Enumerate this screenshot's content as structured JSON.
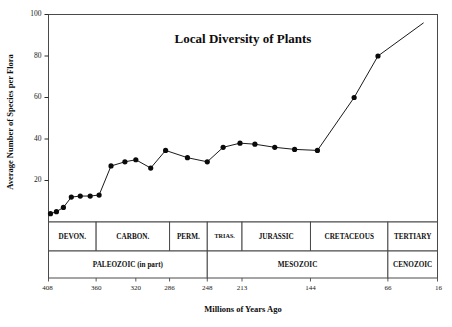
{
  "figure": {
    "title": "Local Diversity of Plants",
    "xlabel": "Millions of Years Ago",
    "ylabel": "Average Number of Species per Flora"
  },
  "chart_data": {
    "type": "line",
    "title": "Local Diversity of Plants",
    "xlabel": "Millions of Years Ago",
    "ylabel": "Average Number of Species per Flora",
    "xlim": [
      408,
      16
    ],
    "ylim": [
      0,
      100
    ],
    "x_inverted": true,
    "grid": false,
    "legend": "none",
    "xticks": [
      408,
      360,
      320,
      286,
      248,
      213,
      144,
      66,
      16
    ],
    "xtick_labels": [
      "408",
      "360",
      "320",
      "286",
      "248",
      "213",
      "144",
      "66",
      "16"
    ],
    "yticks": [
      0,
      20,
      40,
      60,
      80,
      100
    ],
    "ytick_labels": [
      "0",
      "20",
      "40",
      "60",
      "80",
      "100"
    ],
    "series": [
      {
        "name": "Average number of species per flora",
        "marker": "filled-circle",
        "x": [
          406,
          400,
          393,
          385,
          376,
          366,
          357,
          345,
          331,
          320,
          305,
          290,
          268,
          248,
          232,
          215,
          200,
          180,
          160,
          137,
          100,
          76,
          30
        ],
        "y": [
          4,
          5,
          7,
          12,
          12.5,
          12.5,
          13,
          27,
          29,
          30,
          26,
          34.5,
          31,
          29,
          36,
          38,
          37.5,
          36,
          35,
          34.5,
          60,
          80,
          96
        ]
      }
    ],
    "annotations": []
  },
  "timescale": {
    "periods": [
      {
        "label": "DEVON.",
        "start": 408,
        "end": 360,
        "compact": false
      },
      {
        "label": "CARBON.",
        "start": 360,
        "end": 286,
        "compact": false
      },
      {
        "label": "PERM.",
        "start": 286,
        "end": 248,
        "compact": false
      },
      {
        "label": "TRIAS.",
        "start": 248,
        "end": 213,
        "compact": true
      },
      {
        "label": "JURASSIC",
        "start": 213,
        "end": 144,
        "compact": false
      },
      {
        "label": "CRETACEOUS",
        "start": 144,
        "end": 66,
        "compact": false
      },
      {
        "label": "TERTIARY",
        "start": 66,
        "end": 16,
        "compact": false
      }
    ],
    "eras": [
      {
        "label": "PALEOZOIC (in part)",
        "start": 408,
        "end": 248
      },
      {
        "label": "MESOZOIC",
        "start": 248,
        "end": 66
      },
      {
        "label": "CENOZOIC",
        "start": 66,
        "end": 16
      }
    ]
  },
  "colors": {
    "ink": "#1a1a1a",
    "frame": "#4a4a4a",
    "marker": "#0a0a0a",
    "background": "#ffffff"
  }
}
